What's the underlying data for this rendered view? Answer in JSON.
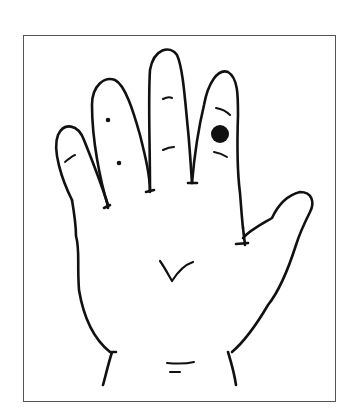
{
  "figure": {
    "marker": {
      "finger": "ring",
      "shape": "filled-circle",
      "color": "#111111"
    },
    "line_color": "#111111",
    "frame_color": "#555555",
    "background": "#ffffff"
  }
}
